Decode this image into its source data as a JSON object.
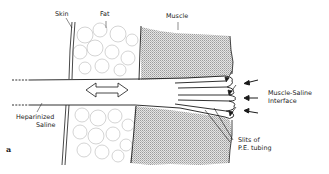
{
  "figure": {
    "panel_label": "a",
    "labels": {
      "skin": "Skin",
      "fat": "Fat",
      "muscle": "Muscle",
      "interface_line1": "Muscle-Saline",
      "interface_line2": "Interface",
      "slits_line1": "Slits of",
      "slits_line2": "P.E. tubing",
      "saline_line1": "Heparinized",
      "saline_line2": "Saline"
    },
    "icons": {
      "flow": "double-arrow-icon",
      "pressure": "arrow-left-icon"
    },
    "colors": {
      "line": "#1a1a1a",
      "muscle_fill": "#d6d6d6",
      "fat_outline": "#9a9a9a",
      "background": "#ffffff"
    }
  }
}
